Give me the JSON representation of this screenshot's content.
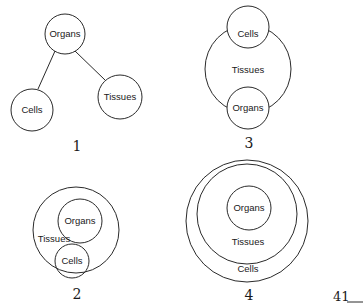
{
  "diagrams": [
    {
      "number": "1",
      "type": "tree",
      "nodes": [
        {
          "label": "Organs"
        },
        {
          "label": "Cells"
        },
        {
          "label": "Tissues"
        }
      ]
    },
    {
      "number": "3",
      "type": "enclosing-circle-with-two-circles-on-boundary",
      "nodes": [
        {
          "label": "Cells"
        },
        {
          "label": "Tissues"
        },
        {
          "label": "Organs"
        }
      ]
    },
    {
      "number": "2",
      "type": "circle-containing-two-circles",
      "nodes": [
        {
          "label": "Organs"
        },
        {
          "label": "Tissues"
        },
        {
          "label": "Cells"
        }
      ]
    },
    {
      "number": "4",
      "type": "concentric-circles",
      "nodes": [
        {
          "label": "Organs"
        },
        {
          "label": "Tissues"
        },
        {
          "label": "Cells"
        }
      ]
    }
  ],
  "page": {
    "number": "41"
  },
  "colors": {
    "stroke": "#2a2a2a",
    "background": "#ffffff"
  }
}
